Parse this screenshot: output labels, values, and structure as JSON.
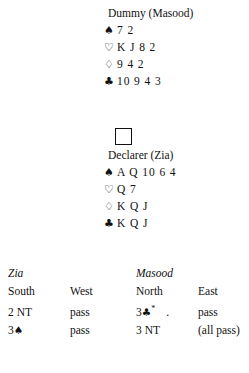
{
  "hands": {
    "dummy": {
      "title": "Dummy (Masood)",
      "suits": [
        {
          "symbol": "♠",
          "name": "spade",
          "cards": "7 2"
        },
        {
          "symbol": "♡",
          "name": "heart",
          "cards": "K J 8 2"
        },
        {
          "symbol": "♢",
          "name": "diamond",
          "cards": "9 4 2"
        },
        {
          "symbol": "♣",
          "name": "club",
          "cards": "10 9 4 3"
        }
      ]
    },
    "declarer": {
      "title": "Declarer (Zia)",
      "suits": [
        {
          "symbol": "♠",
          "name": "spade",
          "cards": "A Q 10 6 4"
        },
        {
          "symbol": "♡",
          "name": "heart",
          "cards": "Q 7"
        },
        {
          "symbol": "♢",
          "name": "diamond",
          "cards": "K Q J"
        },
        {
          "symbol": "♣",
          "name": "club",
          "cards": "K Q J"
        }
      ]
    }
  },
  "auction": {
    "players": {
      "south": "Zia",
      "north": "Masood"
    },
    "headers": {
      "south": "South",
      "west": "West",
      "north": "North",
      "east": "East"
    },
    "rows": [
      {
        "south_bid": "2 NT",
        "south_suit": "",
        "west_bid": "pass",
        "north_bid": "3",
        "north_suit": "♣",
        "north_alert": "*",
        "north_trailing": ".",
        "east_bid": "pass"
      },
      {
        "south_bid": "3",
        "south_suit": "♠",
        "west_bid": "pass",
        "north_bid": "3 NT",
        "north_suit": "",
        "east_bid": "(all pass)"
      }
    ]
  }
}
